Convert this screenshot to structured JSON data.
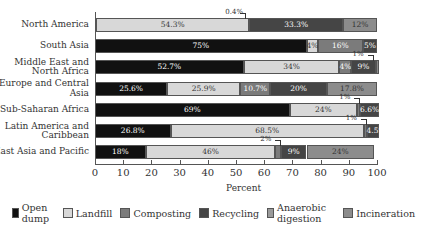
{
  "chart_data": {
    "type": "bar",
    "orientation": "horizontal",
    "stacked": true,
    "title": "",
    "xlabel": "Percent",
    "ylabel": "",
    "xlim": [
      0,
      100
    ],
    "x_ticks": [
      0,
      10,
      20,
      30,
      40,
      50,
      60,
      70,
      80,
      90,
      100
    ],
    "grid": false,
    "legend_position": "bottom",
    "categories": [
      "North America",
      "South Asia",
      "Middle East and North Africa",
      "Europe and Central Asia",
      "Sub-Saharan Africa",
      "Latin America and Caribbean",
      "East Asia and Pacific"
    ],
    "category_lines": [
      [
        "North America"
      ],
      [
        "South Asia"
      ],
      [
        "Middle East and",
        "North Africa"
      ],
      [
        "Europe and Central",
        "Asia"
      ],
      [
        "Sub-Saharan Africa"
      ],
      [
        "Latin America and",
        "Caribbean"
      ],
      [
        "East Asia and Pacific"
      ]
    ],
    "series": [
      {
        "name": "Open dump",
        "color": "#111111",
        "label_color": "#ffffff",
        "values": [
          0.4,
          75,
          52.7,
          25.6,
          69,
          26.8,
          18
        ]
      },
      {
        "name": "Landfill",
        "color": "#d8d8d8",
        "label_color": "#333333",
        "values": [
          54.3,
          4,
          34,
          25.9,
          24,
          68.5,
          46
        ]
      },
      {
        "name": "Composting",
        "color": "#7b7b7b",
        "label_color": "#ffffff",
        "values": [
          0,
          16,
          4,
          10.7,
          1,
          1,
          2
        ]
      },
      {
        "name": "Recycling",
        "color": "#454545",
        "label_color": "#ffffff",
        "values": [
          33.3,
          5,
          9,
          20,
          6.6,
          4.5,
          9
        ]
      },
      {
        "name": "Anaerobic digestion",
        "color": "#9a9a9a",
        "label_color": "#333333",
        "values": [
          0,
          0,
          0,
          0,
          0,
          0,
          0
        ]
      },
      {
        "name": "Incineration",
        "color": "#8c8c8c",
        "label_color": "#333333",
        "values": [
          12,
          0,
          1,
          17.8,
          0,
          0,
          24
        ]
      }
    ],
    "segment_labels": [
      [
        "",
        "54.3%",
        "",
        "33.3%",
        "",
        "12%"
      ],
      [
        "75%",
        "4%",
        "16%",
        "5%",
        "",
        ""
      ],
      [
        "52.7%",
        "34%",
        "4%",
        "9%",
        "",
        ""
      ],
      [
        "25.6%",
        "25.9%",
        "10.7%",
        "20%",
        "",
        "17.8%"
      ],
      [
        "69%",
        "24%",
        "",
        "6.6%",
        "",
        ""
      ],
      [
        "26.8%",
        "68.5%",
        "",
        "4.5%",
        "",
        ""
      ],
      [
        "18%",
        "46%",
        "",
        "9%",
        "",
        "24%"
      ]
    ],
    "callouts": [
      {
        "row": 0,
        "text": "0.4%"
      },
      {
        "row": 2,
        "text": "1%"
      },
      {
        "row": 4,
        "text": "1%"
      },
      {
        "row": 5,
        "text": "1%"
      },
      {
        "row": 6,
        "text": "2%"
      }
    ]
  }
}
